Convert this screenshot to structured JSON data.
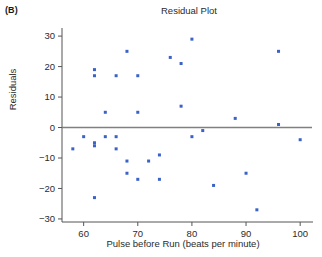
{
  "panel": {
    "label": "(B)"
  },
  "chart_data": {
    "type": "scatter",
    "title": "Residual Plot",
    "xlabel": "Pulse before Run (beats per minute)",
    "ylabel": "Residuals",
    "xlim": [
      56,
      102
    ],
    "ylim": [
      -31,
      32
    ],
    "xticks": [
      60,
      70,
      80,
      90,
      100
    ],
    "yticks": [
      30,
      20,
      10,
      0,
      -10,
      -20,
      -30
    ],
    "grid": false,
    "legend": null,
    "reference_line": {
      "orientation": "horizontal",
      "y": 0,
      "color": "#808080"
    },
    "marker": {
      "color": "#3a62c8",
      "shape": "square",
      "size": 3
    },
    "points": [
      {
        "x": 58,
        "y": -7
      },
      {
        "x": 60,
        "y": -3
      },
      {
        "x": 62,
        "y": 19
      },
      {
        "x": 62,
        "y": 17
      },
      {
        "x": 62,
        "y": -5
      },
      {
        "x": 62,
        "y": -6
      },
      {
        "x": 62,
        "y": -23
      },
      {
        "x": 64,
        "y": 5
      },
      {
        "x": 64,
        "y": -3
      },
      {
        "x": 66,
        "y": 17
      },
      {
        "x": 66,
        "y": -3
      },
      {
        "x": 66,
        "y": -7
      },
      {
        "x": 68,
        "y": 25
      },
      {
        "x": 68,
        "y": -11
      },
      {
        "x": 68,
        "y": -15
      },
      {
        "x": 70,
        "y": 17
      },
      {
        "x": 70,
        "y": 5
      },
      {
        "x": 70,
        "y": -17
      },
      {
        "x": 72,
        "y": -11
      },
      {
        "x": 74,
        "y": -9
      },
      {
        "x": 74,
        "y": -17
      },
      {
        "x": 76,
        "y": 23
      },
      {
        "x": 78,
        "y": 21
      },
      {
        "x": 78,
        "y": 7
      },
      {
        "x": 80,
        "y": 29
      },
      {
        "x": 80,
        "y": -3
      },
      {
        "x": 82,
        "y": -1
      },
      {
        "x": 84,
        "y": -19
      },
      {
        "x": 88,
        "y": 3
      },
      {
        "x": 90,
        "y": -15
      },
      {
        "x": 92,
        "y": -27
      },
      {
        "x": 96,
        "y": 25
      },
      {
        "x": 96,
        "y": 1
      },
      {
        "x": 100,
        "y": -4
      }
    ]
  }
}
